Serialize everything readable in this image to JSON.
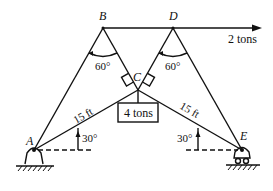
{
  "diagram": {
    "type": "truss/cable statics diagram",
    "points": {
      "A": {
        "label": "A"
      },
      "B": {
        "label": "B"
      },
      "C": {
        "label": "C"
      },
      "D": {
        "label": "D"
      },
      "E": {
        "label": "E"
      }
    },
    "angles": {
      "at_B": "60°",
      "at_D": "60°",
      "at_A": "30°",
      "at_E": "30°"
    },
    "lengths": {
      "AC": "15 ft",
      "CE": "15 ft"
    },
    "loads": {
      "horizontal_force": "2 tons",
      "hanging_weight": "4 tons"
    },
    "supports": {
      "A": "pin support",
      "E": "roller support"
    }
  }
}
